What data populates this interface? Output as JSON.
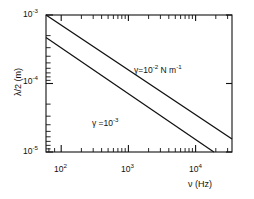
{
  "chart_data": {
    "type": "line",
    "title": "",
    "xlabel": "ν (Hz)",
    "ylabel": "λ/2 (m)",
    "xscale": "log",
    "yscale": "log",
    "xlim": [
      50,
      33000
    ],
    "ylim": [
      1e-05,
      0.001
    ],
    "grid": false,
    "legend_position": "inline-annotation",
    "xticks": [
      {
        "value": 100,
        "mantissa": "10",
        "exponent": "2"
      },
      {
        "value": 1000,
        "mantissa": "10",
        "exponent": "3"
      },
      {
        "value": 10000,
        "mantissa": "10",
        "exponent": "4"
      }
    ],
    "yticks": [
      {
        "value": 0.001,
        "mantissa": "10",
        "exponent": "-3"
      },
      {
        "value": 0.0001,
        "mantissa": "10",
        "exponent": "-4"
      },
      {
        "value": 1e-05,
        "mantissa": "10",
        "exponent": "-5"
      }
    ],
    "series": [
      {
        "name": "gamma-1e-2",
        "annotation_gamma": "γ=10",
        "annotation_exponent": "-2",
        "annotation_units": " N m",
        "annotation_units_exponent": "-1",
        "slope": -0.6667,
        "points": [
          {
            "x": 50,
            "y": 0.001
          },
          {
            "x": 33000,
            "y": 1.55e-05
          }
        ]
      },
      {
        "name": "gamma-1e-3",
        "annotation_gamma": "γ =10",
        "annotation_exponent": "-3",
        "annotation_units": "",
        "annotation_units_exponent": "",
        "slope": -0.6667,
        "points": [
          {
            "x": 50,
            "y": 0.00047
          },
          {
            "x": 17500,
            "y": 1e-05
          }
        ]
      }
    ]
  },
  "axes": {
    "ylabel_text": "λ/2  (m)",
    "xlabel_text": "ν (Hz)"
  },
  "colors": {
    "line": "#111111",
    "frame": "#111111",
    "background": "#ffffff"
  }
}
